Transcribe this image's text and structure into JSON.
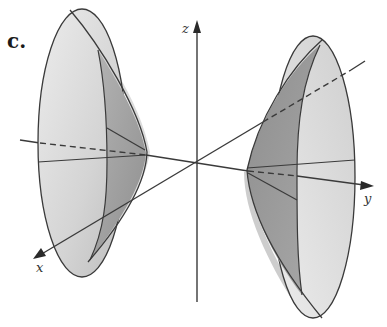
{
  "figure": {
    "panel_label": "c.",
    "axes": {
      "x": {
        "label": "x"
      },
      "y": {
        "label": "y"
      },
      "z": {
        "label": "z"
      }
    },
    "colors": {
      "outer_face": "#d6d6d6",
      "inner_face": "#9e9e9e",
      "shadow": "#b8b8b8",
      "stroke": "#3a3a3a",
      "background": "#ffffff"
    },
    "sheets": [
      {
        "name": "left-sheet",
        "side": "negative-y"
      },
      {
        "name": "right-sheet",
        "side": "positive-y"
      }
    ]
  }
}
